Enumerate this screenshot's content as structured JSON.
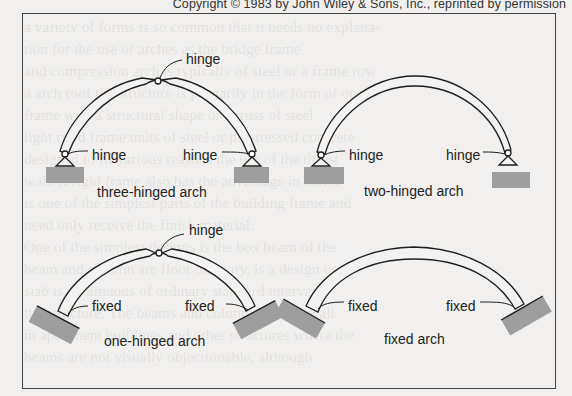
{
  "copyright": "Copyright © 1983 by John Wiley & Sons, Inc., reprinted by permission",
  "background_text": [
    "a variety of forms is so common that it needs no explana-",
    "tion for the use of arches as the bridge frame",
    "and compression arch is typically of steel or a frame row",
    "a arch roof the structure is primarily in the form of open",
    "frame with a structural shape or a truss of steel",
    "light rigid frame units of steel or prestressed concrete",
    "designed to fit various reasons the use of the thrust",
    "wall. A rigid frame also has the advantage in that it",
    "is one of the simplest parts of the building frame and",
    "need only receive the finish material.",
    "One of the simplest designs is the box beam of the",
    "beam and column are floor ordinary, is a design used",
    "slab is continuous of ordinary standard intervals",
    "the structure. The beams and columns are the wall",
    "in apartment buildings and other structures where the",
    "beams are not visually objectionable, although"
  ],
  "diagram": {
    "arches": [
      {
        "id": "three-hinged",
        "caption": "three-hinged arch",
        "labels": {
          "crown": "hinge",
          "left": "hinge",
          "right": "hinge"
        }
      },
      {
        "id": "two-hinged",
        "caption": "two-hinged arch",
        "labels": {
          "left": "hinge",
          "right": "hinge"
        }
      },
      {
        "id": "one-hinged",
        "caption": "one-hinged arch",
        "labels": {
          "crown": "hinge",
          "left": "fixed",
          "right": "fixed"
        }
      },
      {
        "id": "fixed",
        "caption": "fixed arch",
        "labels": {
          "left": "fixed",
          "right": "fixed"
        }
      }
    ],
    "colors": {
      "line": "#1e1e1e",
      "support_fill": "#9e9e9e",
      "arch_fill": "#f3f2f0"
    }
  }
}
